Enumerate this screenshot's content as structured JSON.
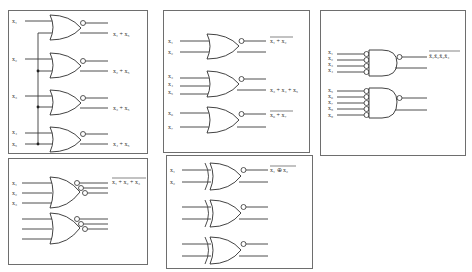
{
  "panels": {
    "or_fanout": {
      "inputs": [
        "x₁",
        "x₂",
        "x₃",
        "x₄",
        "x₅"
      ],
      "outputs": [
        "x₁ + x₅",
        "x₂ + x₅",
        "x₃ + x₅",
        "x₄ + x₅"
      ]
    },
    "nor_three": {
      "inputs": [
        "x₁",
        "x₂",
        "x₃"
      ],
      "output": "x₁ + x₂ + x₃"
    },
    "nor_groups": {
      "gate1": {
        "inputs": [
          "x₁",
          "x₂"
        ],
        "output": "x₁ + x₂"
      },
      "gate2": {
        "inputs": [
          "x₃",
          "x₄",
          "x₅"
        ],
        "output": "x₃ + x₄ + x₅"
      },
      "gate3": {
        "inputs": [
          "x₆",
          "x₇"
        ],
        "output": "x₆ + x₇"
      }
    },
    "xnor": {
      "inputs": [
        "x₁",
        "x₂"
      ],
      "output": "x₁ ⊕ x₂"
    },
    "nand_inverted": {
      "gate1": {
        "inputs": [
          "x₁",
          "x₂",
          "x₃",
          "x₄"
        ],
        "output": "x̄₁x̄₂x̄₃x̄₄"
      },
      "gate2": {
        "inputs": [
          "x₅",
          "x₆",
          "x₇",
          "x₈",
          "x₉"
        ]
      }
    }
  },
  "colors": {
    "line": "#2e2e2e",
    "border": "#6e6e6e",
    "background": "#ffffff"
  }
}
